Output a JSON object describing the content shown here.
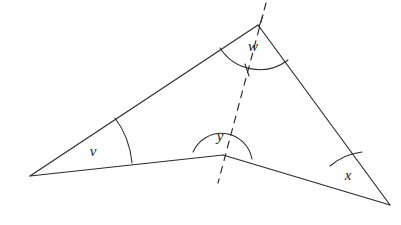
{
  "figure": {
    "title": "Triangle with transversal dashed line and labelled angles",
    "background_color": "#ffffff",
    "stroke_color": "#2b2b2b",
    "width": 401,
    "height": 225
  },
  "points": {
    "left_vertex": {
      "name": "left-vertex",
      "x": 30,
      "y": 176
    },
    "top_vertex": {
      "name": "top-vertex",
      "x": 258,
      "y": 25
    },
    "bend_vertex": {
      "name": "bend-vertex",
      "x": 223,
      "y": 155
    },
    "right_vertex": {
      "name": "right-vertex",
      "x": 390,
      "y": 205
    }
  },
  "edges": [
    {
      "name": "edge-left-to-top",
      "d": "M 30 176 L 258 25"
    },
    {
      "name": "edge-top-to-right",
      "d": "M 258 25 L 390 205"
    },
    {
      "name": "edge-left-to-bend",
      "d": "M 30 176 L 223 155"
    },
    {
      "name": "edge-bend-to-right",
      "d": "M 223 155 L 390 205"
    }
  ],
  "dashed_line": {
    "name": "dashed-transversal",
    "d": "M 266 3 L 218 183",
    "dash_pattern": "7 6"
  },
  "angles": [
    {
      "id": "v",
      "label": "v",
      "vertex": "left-vertex",
      "label_x": 93,
      "label_y": 153,
      "arc_d": "M 115 118 A 88 88 0 0 1 132 163",
      "arc_name": "angle-arc-v",
      "description": "interior angle at left vertex between the upper edge and the lower edge"
    },
    {
      "id": "w",
      "label": "w",
      "vertex": "top-vertex",
      "label_x": 253,
      "label_y": 48,
      "arc_d": "M 220 48 A 47 47 0 0 0 288 60",
      "arc_name": "angle-arc-w",
      "description": "angle at top vertex between the left edge and the right edge, bisected by the dashed line"
    },
    {
      "id": "y",
      "label": "y",
      "vertex": "bend-vertex",
      "label_x": 220,
      "label_y": 138,
      "arc_d": "M 193 152 A 31 31 0 0 1 252 159",
      "arc_name": "angle-arc-y",
      "description": "reflex-style angle above the bend vertex spanning both lower edges"
    },
    {
      "id": "x",
      "label": "x",
      "vertex": "right-vertex",
      "label_x": 348,
      "label_y": 177,
      "arc_d": "M 330 166 A 60 60 0 0 1 362 152",
      "arc_name": "angle-arc-x",
      "description": "interior angle at right vertex between the lower edge and the right edge"
    }
  ],
  "tick_marks": [
    {
      "name": "tick-top-dashed",
      "d": "M 259 27 L 263 15"
    },
    {
      "name": "tick-arc-dashed",
      "d": "M 245 64 L 249 76"
    }
  ]
}
